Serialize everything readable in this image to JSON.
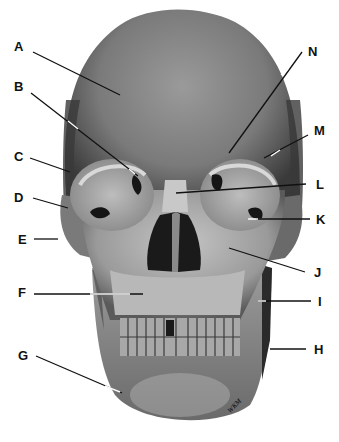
{
  "diagram": {
    "signature": "WKM",
    "colors": {
      "background": "#ffffff",
      "bone_dark": "#4a4a4a",
      "bone_mid": "#8a8a8a",
      "bone_light": "#c8c8c8",
      "cavity": "#151515",
      "leader_line": "#111111"
    },
    "labels": [
      {
        "id": "A",
        "text": "A",
        "x": 14,
        "y": 40
      },
      {
        "id": "B",
        "text": "B",
        "x": 14,
        "y": 80
      },
      {
        "id": "C",
        "text": "C",
        "x": 14,
        "y": 150
      },
      {
        "id": "D",
        "text": "D",
        "x": 14,
        "y": 191
      },
      {
        "id": "E",
        "text": "E",
        "x": 18,
        "y": 233
      },
      {
        "id": "F",
        "text": "F",
        "x": 18,
        "y": 286
      },
      {
        "id": "G",
        "text": "G",
        "x": 18,
        "y": 349
      },
      {
        "id": "H",
        "text": "H",
        "x": 314,
        "y": 346
      },
      {
        "id": "I",
        "text": "I",
        "x": 317,
        "y": 297
      },
      {
        "id": "J",
        "text": "J",
        "x": 314,
        "y": 265
      },
      {
        "id": "K",
        "text": "K",
        "x": 316,
        "y": 213
      },
      {
        "id": "L",
        "text": "L",
        "x": 316,
        "y": 178
      },
      {
        "id": "M",
        "text": "M",
        "x": 314,
        "y": 124
      },
      {
        "id": "N",
        "text": "N",
        "x": 310,
        "y": 45
      }
    ]
  }
}
